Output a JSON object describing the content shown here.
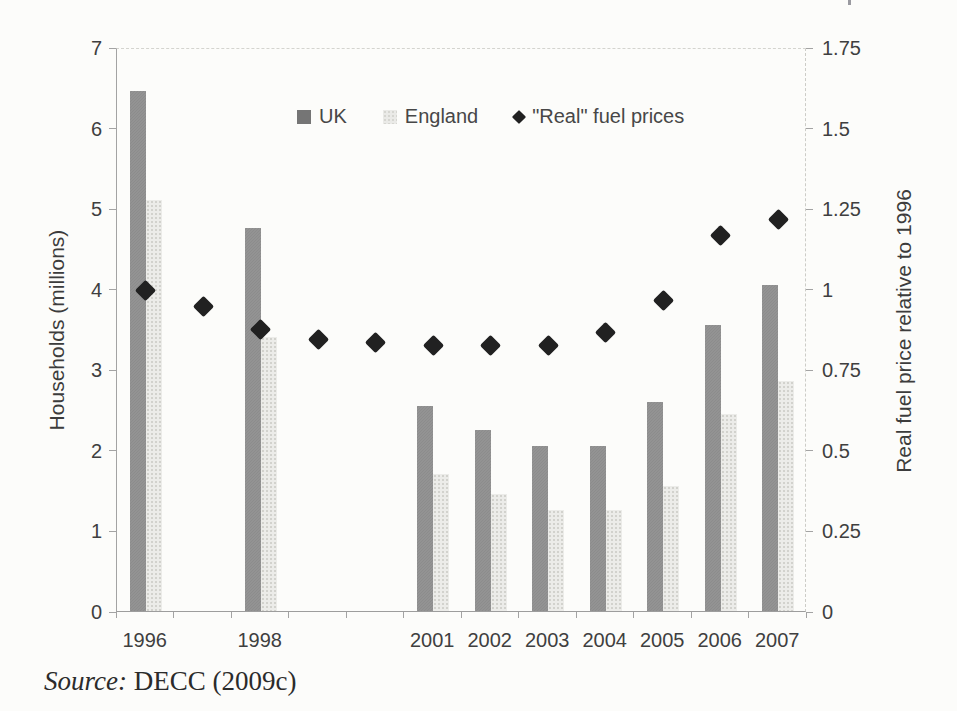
{
  "figure": {
    "source_label": "Source:",
    "source_text": " DECC (2009c)"
  },
  "legend": {
    "uk_label": "UK",
    "england_label": "England",
    "fuel_label": "\"Real\" fuel prices"
  },
  "chart_data": {
    "type": "combo (grouped bars + diamond scatter, dual axis)",
    "title": "",
    "categories": [
      1996,
      1997,
      1998,
      1999,
      2000,
      2001,
      2002,
      2003,
      2004,
      2005,
      2006,
      2007
    ],
    "x_tick_labels": [
      "1996",
      "",
      "1998",
      "",
      "",
      "2001",
      "2002",
      "2003",
      "2004",
      "2005",
      "2006",
      "2007"
    ],
    "series": [
      {
        "name": "UK",
        "type": "bar",
        "axis": "left",
        "color": "#8c8c8c",
        "values": [
          6.45,
          null,
          4.75,
          null,
          null,
          2.55,
          2.25,
          2.05,
          2.05,
          2.6,
          3.55,
          4.05
        ]
      },
      {
        "name": "England",
        "type": "bar",
        "axis": "left",
        "color": "#ecece9",
        "values": [
          5.1,
          null,
          3.4,
          null,
          null,
          1.7,
          1.45,
          1.25,
          1.25,
          1.55,
          2.45,
          2.85
        ]
      },
      {
        "name": "\"Real\" fuel prices",
        "type": "scatter-diamond",
        "axis": "right",
        "color": "#212121",
        "values": [
          1.0,
          0.95,
          0.88,
          0.85,
          0.84,
          0.83,
          0.83,
          0.83,
          0.87,
          0.97,
          1.17,
          1.22
        ]
      }
    ],
    "left_axis": {
      "label": "Households (millions)",
      "min": 0,
      "max": 7,
      "ticks": [
        0,
        1,
        2,
        3,
        4,
        5,
        6,
        7
      ]
    },
    "right_axis": {
      "label": "Real fuel price relative to 1996",
      "min": 0,
      "max": 1.75,
      "ticks": [
        0,
        0.25,
        0.5,
        0.75,
        1,
        1.25,
        1.5,
        1.75
      ],
      "tick_labels": [
        "0",
        "0.25",
        "0.5",
        "0.75",
        "1",
        "1.25",
        "1.5",
        "1.75"
      ]
    },
    "legend_entries": [
      "UK",
      "England",
      "\"Real\" fuel prices"
    ],
    "legend_position": "inside-top-center",
    "grid": false
  }
}
